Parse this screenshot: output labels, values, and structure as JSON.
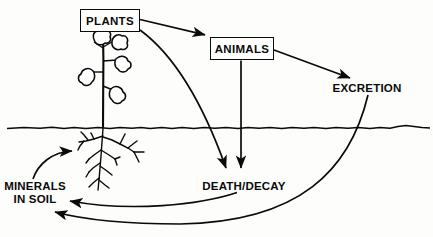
{
  "diagram": {
    "ground_line_label": "soil-surface-line",
    "stroke_color": "#0a0a0a",
    "background_color": "#fdfdfc",
    "nodes": [
      {
        "id": "plants",
        "label": "PLANTS",
        "shape": "box",
        "x": 80,
        "y": 9
      },
      {
        "id": "animals",
        "label": "ANIMALS",
        "shape": "box",
        "x": 210,
        "y": 37
      },
      {
        "id": "excretion",
        "label": "EXCRETION",
        "shape": "text",
        "x": 330,
        "y": 82
      },
      {
        "id": "death",
        "label": "DEATH/DECAY",
        "shape": "text",
        "x": 199,
        "y": 180
      },
      {
        "id": "minerals",
        "label": "MINERALS\nIN SOIL",
        "shape": "text",
        "x": 4,
        "y": 180
      }
    ],
    "minerals_line1": "MINERALS",
    "minerals_line2": "IN SOIL",
    "edges": [
      {
        "from": "plants",
        "to": "animals",
        "style": "straight-arrow"
      },
      {
        "from": "plants",
        "to": "death",
        "style": "curve-arrow"
      },
      {
        "from": "animals",
        "to": "death",
        "style": "straight-arrow"
      },
      {
        "from": "animals",
        "to": "excretion",
        "style": "straight-arrow"
      },
      {
        "from": "death",
        "to": "minerals",
        "style": "curve-arrow"
      },
      {
        "from": "excretion",
        "to": "minerals",
        "style": "curve-arrow"
      },
      {
        "from": "minerals",
        "to": "plants-roots",
        "style": "curve-arrow"
      }
    ]
  }
}
